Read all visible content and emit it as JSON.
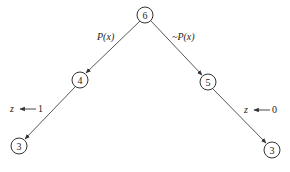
{
  "nodes": [
    {
      "id": "root",
      "label": "6",
      "x": 145,
      "y": 15
    },
    {
      "id": "left",
      "label": "4",
      "x": 80,
      "y": 80
    },
    {
      "id": "right",
      "label": "5",
      "x": 208,
      "y": 82
    },
    {
      "id": "left-leaf",
      "label": "3",
      "x": 19,
      "y": 146
    },
    {
      "id": "right-leaf",
      "label": "3",
      "x": 272,
      "y": 150
    }
  ],
  "edges": [
    {
      "from": "root",
      "to": "left",
      "label": "P(x)"
    },
    {
      "from": "root",
      "to": "right",
      "label": "~P(x)"
    },
    {
      "from": "left",
      "to": "left-leaf"
    },
    {
      "from": "right",
      "to": "right-leaf"
    }
  ],
  "assignments": [
    {
      "var": "z",
      "value": "1",
      "side": "left"
    },
    {
      "var": "z",
      "value": "0",
      "side": "right"
    }
  ]
}
